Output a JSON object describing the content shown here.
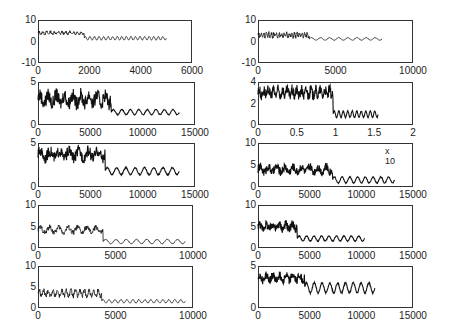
{
  "chart_data": [
    {
      "type": "line",
      "position": "row1-left",
      "x_ticks": [
        "0",
        "2000",
        "4000",
        "6000"
      ],
      "y_ticks": [
        "10",
        "0",
        "-10"
      ],
      "xlim": [
        0,
        6000
      ],
      "ylim": [
        -10,
        10
      ],
      "series": [
        {
          "name": "signal",
          "x_end": 5000,
          "switch_x": 1800,
          "high_level": 4,
          "high_amp": 1.2,
          "low_level": 1.5,
          "low_amp": 0.8,
          "periods_high": 12,
          "periods_low": 18
        }
      ]
    },
    {
      "type": "line",
      "position": "row1-right",
      "x_ticks": [
        "0",
        "5000",
        "10000"
      ],
      "y_ticks": [
        "10",
        "0",
        "-10"
      ],
      "xlim": [
        0,
        10000
      ],
      "ylim": [
        -10,
        10
      ],
      "series": [
        {
          "name": "signal",
          "x_end": 8000,
          "switch_x": 3300,
          "high_level": 3,
          "high_amp": 1.8,
          "low_level": 1.2,
          "low_amp": 0.6,
          "periods_high": 20,
          "periods_low": 8
        }
      ]
    },
    {
      "type": "line",
      "position": "row2-left",
      "x_ticks": [
        "0",
        "5000",
        "10000",
        "15000"
      ],
      "y_ticks": [
        "5",
        "0"
      ],
      "xlim": [
        0,
        15000
      ],
      "ylim": [
        0,
        5
      ],
      "series": [
        {
          "name": "signal",
          "x_end": 13500,
          "switch_x": 7000,
          "high_level": 3.0,
          "high_amp": 1.0,
          "low_level": 1.5,
          "low_amp": 0.3,
          "periods_high": 9,
          "periods_low": 8,
          "dense": true
        }
      ]
    },
    {
      "type": "line",
      "position": "row2-right",
      "x_ticks": [
        "0",
        "0.5",
        "1",
        "1.5",
        "2"
      ],
      "y_ticks": [
        "4",
        "2",
        "0"
      ],
      "xlim": [
        0,
        2
      ],
      "ylim": [
        0,
        4
      ],
      "series": [
        {
          "name": "signal",
          "x_end": 1.55,
          "switch_x": 0.97,
          "high_level": 3.0,
          "high_amp": 0.6,
          "low_level": 1.0,
          "low_amp": 0.3,
          "periods_high": 16,
          "periods_low": 10,
          "dense": true
        }
      ]
    },
    {
      "type": "line",
      "position": "row3-left",
      "x_ticks": [
        "0",
        "5000",
        "10000",
        "15000"
      ],
      "y_ticks": [
        "5",
        "0"
      ],
      "xlim": [
        0,
        15000
      ],
      "ylim": [
        0,
        5
      ],
      "series": [
        {
          "name": "signal",
          "x_end": 13500,
          "switch_x": 6400,
          "high_level": 3.7,
          "high_amp": 0.8,
          "low_level": 1.8,
          "low_amp": 0.4,
          "periods_high": 7,
          "periods_low": 8,
          "dense": true
        }
      ]
    },
    {
      "type": "line",
      "position": "row3-right",
      "x_ticks": [
        "0",
        "5000",
        "10000",
        "15000"
      ],
      "y_ticks": [
        "10",
        "5",
        "0"
      ],
      "xlim": [
        0,
        15000
      ],
      "ylim": [
        0,
        10
      ],
      "multiplier_label": "x 10",
      "series": [
        {
          "name": "signal",
          "x_end": 13200,
          "switch_x": 7200,
          "high_level": 4.0,
          "high_amp": 1.2,
          "low_level": 1.6,
          "low_amp": 0.7,
          "periods_high": 9,
          "periods_low": 8,
          "dense": true
        }
      ]
    },
    {
      "type": "line",
      "position": "row4-left",
      "x_ticks": [
        "0",
        "5000",
        "10000"
      ],
      "y_ticks": [
        "10",
        "5",
        "0"
      ],
      "xlim": [
        0,
        10000
      ],
      "ylim": [
        0,
        10
      ],
      "series": [
        {
          "name": "signal",
          "x_end": 9500,
          "switch_x": 4200,
          "high_level": 4.2,
          "high_amp": 1.3,
          "low_level": 1.5,
          "low_amp": 0.5,
          "periods_high": 7,
          "periods_low": 8
        }
      ]
    },
    {
      "type": "line",
      "position": "row4-right",
      "x_ticks": [
        "0",
        "5000",
        "10000",
        "15000"
      ],
      "y_ticks": [
        "10",
        "5",
        "0"
      ],
      "xlim": [
        0,
        15000
      ],
      "ylim": [
        0,
        10
      ],
      "series": [
        {
          "name": "signal",
          "x_end": 10300,
          "switch_x": 3800,
          "high_level": 5.0,
          "high_amp": 1.2,
          "low_level": 2.2,
          "low_amp": 0.6,
          "periods_high": 6,
          "periods_low": 9,
          "dense": true
        }
      ]
    },
    {
      "type": "line",
      "position": "row5-left",
      "x_ticks": [
        "0",
        "5000",
        "10000"
      ],
      "y_ticks": [
        "10",
        "5",
        "0"
      ],
      "xlim": [
        0,
        10000
      ],
      "ylim": [
        0,
        10
      ],
      "series": [
        {
          "name": "signal",
          "x_end": 9500,
          "switch_x": 4100,
          "high_level": 3.5,
          "high_amp": 1.3,
          "low_level": 1.6,
          "low_amp": 0.4,
          "periods_high": 14,
          "periods_low": 14
        }
      ]
    },
    {
      "type": "line",
      "position": "row5-right",
      "x_ticks": [
        "0",
        "5000",
        "10000",
        "15000"
      ],
      "y_ticks": [
        "5",
        "0"
      ],
      "xlim": [
        0,
        15000
      ],
      "ylim": [
        0,
        5
      ],
      "series": [
        {
          "name": "signal",
          "x_end": 11300,
          "switch_x": 4500,
          "high_level": 3.6,
          "high_amp": 0.6,
          "low_level": 2.4,
          "low_amp": 0.6,
          "periods_high": 7,
          "periods_low": 9,
          "dense": true
        }
      ]
    }
  ],
  "layout": {
    "panels": [
      {
        "left": 38,
        "top": 20,
        "width": 154,
        "height": 43
      },
      {
        "left": 258,
        "top": 20,
        "width": 155,
        "height": 43
      },
      {
        "left": 38,
        "top": 82,
        "width": 157,
        "height": 43
      },
      {
        "left": 258,
        "top": 82,
        "width": 155,
        "height": 43
      },
      {
        "left": 38,
        "top": 143,
        "width": 157,
        "height": 44
      },
      {
        "left": 258,
        "top": 143,
        "width": 155,
        "height": 44
      },
      {
        "left": 38,
        "top": 205,
        "width": 155,
        "height": 43
      },
      {
        "left": 258,
        "top": 205,
        "width": 155,
        "height": 43
      },
      {
        "left": 38,
        "top": 266,
        "width": 155,
        "height": 42
      },
      {
        "left": 258,
        "top": 266,
        "width": 155,
        "height": 42
      }
    ]
  }
}
